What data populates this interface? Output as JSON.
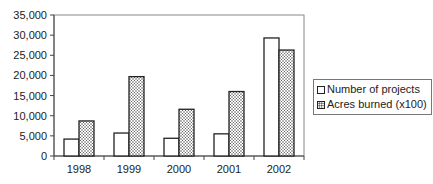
{
  "chart_data": {
    "type": "bar",
    "title": "",
    "xlabel": "",
    "ylabel": "",
    "categories": [
      "1998",
      "1999",
      "2000",
      "2001",
      "2002"
    ],
    "series": [
      {
        "name": "Number of projects",
        "values": [
          4200,
          5700,
          4400,
          5500,
          29300
        ],
        "fill": "white"
      },
      {
        "name": "Acres burned (x100)",
        "values": [
          8700,
          19700,
          11600,
          16000,
          26300
        ],
        "fill": "dotted"
      }
    ],
    "ylim": [
      0,
      35000
    ],
    "yticks": [
      0,
      5000,
      10000,
      15000,
      20000,
      25000,
      30000,
      35000
    ],
    "ytick_labels": [
      "0",
      "5,000",
      "10,000",
      "15,000",
      "20,000",
      "25,000",
      "30,000",
      "35,000"
    ],
    "grid": false,
    "legend_position": "right"
  },
  "legend": {
    "items": [
      {
        "label": "Number of projects"
      },
      {
        "label": "Acres burned (x100)"
      }
    ]
  }
}
